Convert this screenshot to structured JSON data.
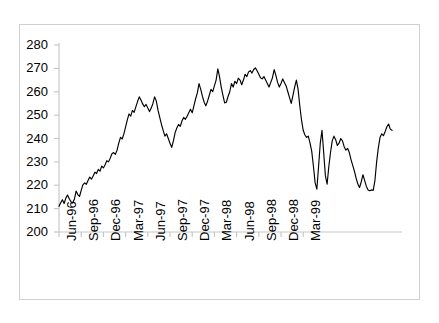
{
  "chart_data": {
    "type": "line",
    "title": "",
    "xlabel": "",
    "ylabel": "",
    "ylim": [
      200,
      280
    ],
    "yticks": [
      200,
      210,
      220,
      230,
      240,
      250,
      260,
      270,
      280
    ],
    "ytick_labels": [
      "200",
      "210",
      "220",
      "230",
      "240",
      "250",
      "260",
      "270",
      "280"
    ],
    "grid": false,
    "legend": "none",
    "series_color": "#000000",
    "axis_color": "#c8c8c8",
    "frame_color": "#d0d0d0",
    "xtick_labels": [
      "Jun-96",
      "Sep-96",
      "Dec-96",
      "Mar-97",
      "Jun-97",
      "Sep-97",
      "Dec-97",
      "Mar-98",
      "Jun-98",
      "Sep-98",
      "Dec-98",
      "Mar-99"
    ],
    "x_start": "Jun-96",
    "x_end": "Jun-99",
    "n_points": 158,
    "values": [
      211.0,
      212.5,
      213.8,
      212.2,
      214.5,
      215.8,
      214.2,
      213.0,
      212.4,
      214.0,
      217.5,
      216.0,
      215.2,
      217.8,
      220.2,
      221.0,
      220.4,
      222.0,
      223.5,
      222.6,
      224.0,
      225.6,
      225.0,
      226.8,
      226.0,
      228.2,
      227.4,
      228.8,
      230.5,
      230.0,
      231.6,
      233.5,
      234.0,
      233.2,
      235.0,
      238.0,
      240.5,
      239.8,
      242.0,
      245.0,
      248.0,
      250.5,
      249.6,
      252.0,
      251.2,
      253.5,
      255.8,
      257.8,
      256.5,
      254.8,
      253.6,
      254.6,
      253.0,
      251.5,
      253.0,
      255.0,
      257.8,
      256.0,
      252.0,
      249.0,
      246.0,
      243.5,
      241.0,
      242.0,
      240.0,
      238.0,
      236.2,
      239.0,
      242.5,
      244.5,
      246.0,
      245.2,
      247.5,
      249.0,
      248.2,
      249.5,
      251.0,
      252.5,
      251.0,
      254.0,
      257.0,
      259.5,
      263.5,
      261.0,
      258.0,
      255.5,
      254.0,
      256.0,
      258.5,
      261.0,
      260.0,
      262.5,
      265.0,
      269.8,
      266.5,
      262.0,
      258.5,
      255.2,
      255.5,
      258.0,
      260.0,
      263.5,
      262.0,
      264.5,
      263.5,
      265.8,
      265.0,
      263.0,
      265.0,
      267.5,
      266.5,
      268.5,
      269.0,
      268.0,
      269.5,
      270.2,
      269.0,
      267.5,
      266.0,
      265.5,
      266.5,
      265.0,
      263.5,
      262.0,
      264.0,
      266.0,
      269.5,
      267.0,
      264.0,
      262.0,
      263.5,
      265.5,
      264.0,
      262.5,
      260.0,
      257.5,
      255.0,
      258.5,
      262.0,
      265.0,
      261.0,
      254.0,
      248.0,
      243.5,
      241.5,
      240.5,
      241.0,
      238.0,
      234.5,
      228.0,
      221.0,
      218.3,
      228.0,
      238.0,
      243.5,
      234.0,
      224.0,
      220.5,
      228.0,
      234.0,
      239.0,
      241.0,
      239.5,
      237.0,
      238.0,
      240.0,
      239.0,
      236.5,
      235.0,
      235.8,
      234.0,
      231.0,
      228.5,
      226.0,
      223.0,
      220.5,
      219.0,
      221.5,
      224.5,
      222.0,
      219.5,
      218.0,
      217.6,
      218.0,
      217.8,
      222.0,
      230.0,
      236.0,
      240.5,
      242.0,
      241.2,
      243.0,
      245.0,
      246.2,
      244.0,
      243.5
    ]
  }
}
